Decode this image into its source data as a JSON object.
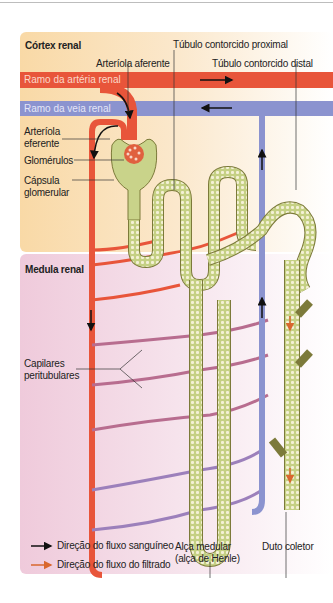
{
  "diagram": {
    "regions": {
      "cortex": "Córtex renal",
      "medulla": "Medula renal"
    },
    "vessels": {
      "artery_branch": "Ramo da artéria renal",
      "vein_branch": "Ramo da veia renal"
    },
    "labels": {
      "afferent_arteriole": "Arteríola aferente",
      "proximal_tubule": "Túbulo contorcido proximal",
      "distal_tubule": "Túbulo contorcido distal",
      "efferent_arteriole_1": "Arteríola",
      "efferent_arteriole_2": "eferente",
      "glomeruli": "Glomérulos",
      "capsule_1": "Cápsula",
      "capsule_2": "glomerular",
      "peritubular_1": "Capilares",
      "peritubular_2": "peritubulares",
      "loop_1": "Alça medular",
      "loop_2": "(alça de Henle)",
      "collecting_duct": "Duto coletor"
    },
    "legend": [
      {
        "label": "Direção do fluxo sanguíneo",
        "color": "#111111"
      },
      {
        "label": "Direção do fluxo do filtrado",
        "color": "#d9672e"
      }
    ],
    "colors": {
      "artery": "#e8553a",
      "vein": "#8b93cf",
      "tubule": "#c9d38a",
      "cortex_bg": "#fbe6c4",
      "medulla_bg": "#f3dbe6"
    }
  }
}
